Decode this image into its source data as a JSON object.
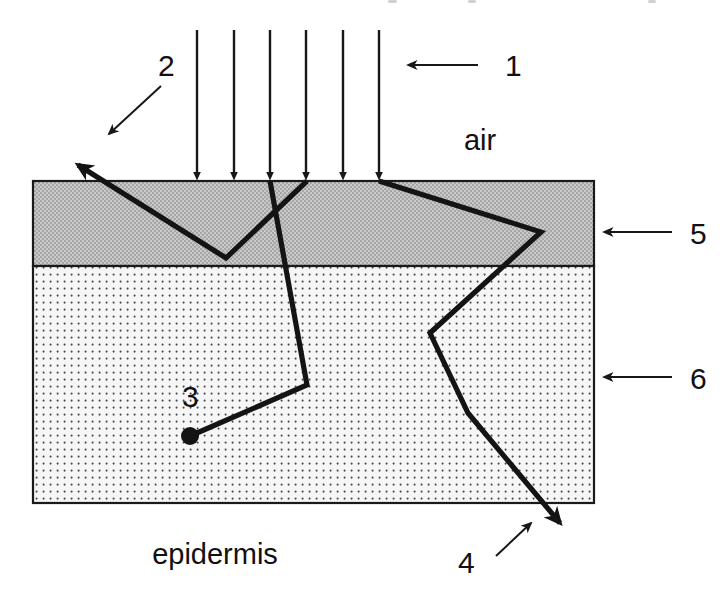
{
  "figure": {
    "title_region_partial_text": "",
    "background_color": "#ffffff",
    "ink_color": "#141414"
  },
  "media_labels": {
    "above": "air",
    "below": "epidermis"
  },
  "numbered_callouts": [
    {
      "id": "1",
      "label": "1",
      "text_x": 505,
      "text_y": 76,
      "arrow": {
        "x1": 478,
        "y1": 65,
        "x2": 398,
        "y2": 65
      },
      "meaning": "incident-beam"
    },
    {
      "id": "2",
      "label": "2",
      "text_x": 158,
      "text_y": 76,
      "arrow": {
        "x1": 161,
        "y1": 86,
        "x2": 101,
        "y2": 141
      },
      "meaning": "specular-reflection"
    },
    {
      "id": "3",
      "label": "3",
      "text_x": 182,
      "text_y": 407,
      "arrow": null,
      "meaning": "absorbed-photon-terminus"
    },
    {
      "id": "4",
      "label": "4",
      "text_x": 458,
      "text_y": 573,
      "arrow": {
        "x1": 496,
        "y1": 556,
        "x2": 538,
        "y2": 517
      },
      "meaning": "transmitted-photon"
    },
    {
      "id": "5",
      "label": "5",
      "text_x": 690,
      "text_y": 244,
      "arrow": {
        "x1": 672,
        "y1": 232,
        "x2": 594,
        "y2": 232
      },
      "meaning": "upper-layer-stratum"
    },
    {
      "id": "6",
      "label": "6",
      "text_x": 690,
      "text_y": 389,
      "arrow": {
        "x1": 672,
        "y1": 377,
        "x2": 594,
        "y2": 377
      },
      "meaning": "lower-layer-dermis"
    }
  ],
  "layers": [
    {
      "name": "upper-layer",
      "callout": "5",
      "x": 33,
      "y": 181,
      "width": 561,
      "height": 85,
      "fill": "#c9c9c9",
      "pattern": "dense-checker"
    },
    {
      "name": "lower-layer",
      "callout": "6",
      "x": 33,
      "y": 266,
      "width": 561,
      "height": 237,
      "fill": "#f4f4f4",
      "pattern": "sparse-dots"
    }
  ],
  "incident_beam": {
    "count": 6,
    "x_positions": [
      197,
      234,
      270,
      306,
      343,
      379
    ],
    "y_start": 30,
    "y_end": 181
  },
  "photon_paths": [
    {
      "name": "reflected-path",
      "points": "62,155 226,258 307,181",
      "arrowhead": {
        "x": 62,
        "y": 155,
        "angle": -148
      }
    },
    {
      "name": "scattered-path-left",
      "points": "270,181 307,385 190,436",
      "arrowhead": null
    },
    {
      "name": "scattered-path-right",
      "points": "379,181 541,232 430,333 468,413 574,534",
      "arrowhead": {
        "x": 574,
        "y": 534,
        "angle": 48
      }
    }
  ],
  "absorption_dot": {
    "x": 190,
    "y": 436,
    "r": 9
  }
}
